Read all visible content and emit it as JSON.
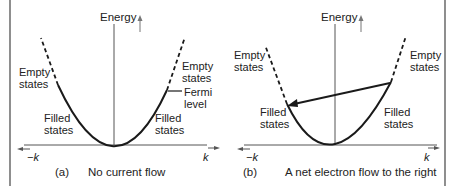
{
  "figure": {
    "panel_a": {
      "axis_label": "Energy",
      "empty_left": [
        "Empty",
        "states"
      ],
      "empty_right": [
        "Empty",
        "states"
      ],
      "fermi": [
        "Fermi",
        "level"
      ],
      "filled_left": [
        "Filled",
        "states"
      ],
      "filled_right": [
        "Filled",
        "states"
      ],
      "k_neg": "−k",
      "k_pos": "k",
      "caption_letter": "(a)",
      "caption": "No current flow"
    },
    "panel_b": {
      "axis_label": "Energy",
      "empty_left": [
        "Empty",
        "states"
      ],
      "empty_right": [
        "Empty",
        "states"
      ],
      "filled_left": [
        "Filled",
        "states"
      ],
      "filled_right": [
        "Filled",
        "states"
      ],
      "k_neg": "−k",
      "k_pos": "k",
      "caption_letter": "(b)",
      "caption": "A net electron flow to the right"
    },
    "colors": {
      "line": "#1a1a1a",
      "axis": "#555555",
      "border": "#444444"
    }
  }
}
